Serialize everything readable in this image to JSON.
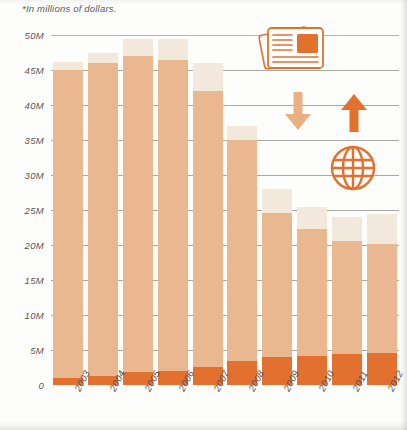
{
  "note": "*In millions of dollars.",
  "chart_data": {
    "type": "bar",
    "title": "",
    "subtitle": "*In millions of dollars.",
    "xlabel": "",
    "ylabel": "",
    "ylim": [
      0,
      50
    ],
    "y_unit": "millions of dollars",
    "grid": true,
    "legend": "none",
    "stacked": true,
    "categories": [
      "2003",
      "2004",
      "2005",
      "2006",
      "2007",
      "2008",
      "2009",
      "2010",
      "2011",
      "2012"
    ],
    "ytick_labels": [
      "0",
      "5M",
      "10M",
      "15M",
      "20M",
      "25M",
      "30M",
      "35M",
      "40M",
      "45M",
      "50M"
    ],
    "ytick_values": [
      0,
      5,
      10,
      15,
      20,
      25,
      30,
      35,
      40,
      45,
      50
    ],
    "series": [
      {
        "name": "lower-segment",
        "color": "#e2702f",
        "values": [
          1.0,
          1.3,
          1.8,
          2.0,
          2.6,
          3.4,
          4.0,
          4.2,
          4.4,
          4.6
        ]
      },
      {
        "name": "middle-segment",
        "color": "#e9b890",
        "values": [
          44.0,
          44.7,
          45.2,
          44.5,
          39.4,
          31.6,
          20.6,
          18.1,
          16.2,
          15.6
        ]
      },
      {
        "name": "upper-segment",
        "color": "#f2e8db",
        "values": [
          1.2,
          1.5,
          2.5,
          3.0,
          4.0,
          2.0,
          3.4,
          3.2,
          3.4,
          4.3
        ]
      }
    ],
    "totals": [
      46.2,
      47.5,
      49.5,
      49.5,
      46.0,
      37.0,
      28.0,
      25.5,
      24.0,
      24.5
    ]
  },
  "icons": {
    "newspaper": "newspaper-icon",
    "arrow_down": "arrow-down-icon",
    "arrow_up": "arrow-up-icon",
    "globe": "globe-icon"
  },
  "colors": {
    "lower": "#e2702f",
    "middle": "#e9b890",
    "upper": "#f2e8db",
    "grid": "#9a9a96",
    "text": "#55555a"
  }
}
